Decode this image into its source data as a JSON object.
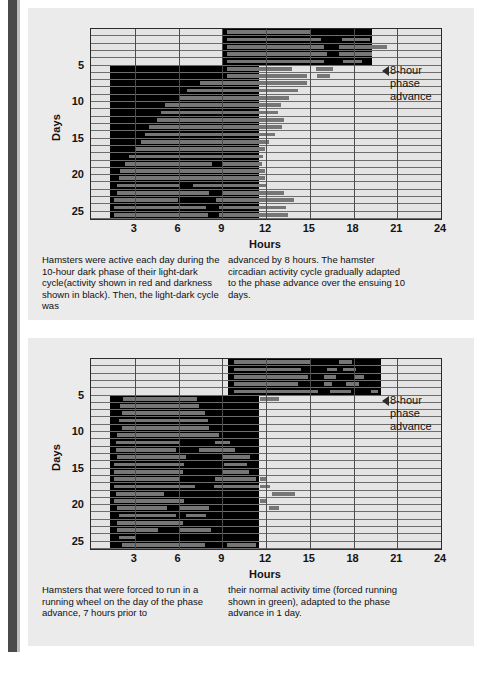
{
  "page": {
    "background": "#ffffff",
    "panel_background": "#ebebeb",
    "spine_color": "#4a4a4a",
    "ink": "#111111"
  },
  "panels": [
    {
      "id": "top",
      "annotation": {
        "icon": "left-arrow-icon",
        "lines": [
          "8-hour",
          "phase",
          "advance"
        ]
      },
      "caption": {
        "left": "Hamsters were active each day during the 10-hour dark phase of their light-dark cycle(activity shown in red and darkness shown in black). Then, the light-dark cycle was",
        "right": "advanced by 8 hours. The hamster circadian activity cycle gradually adapted to the phase advance over the ensuing 10 days."
      },
      "chart_data": {
        "type": "actogram",
        "title": "",
        "xlabel": "Hours",
        "ylabel": "Days",
        "xlim": [
          0,
          24
        ],
        "ylim": [
          0,
          27
        ],
        "xticks": [
          3,
          6,
          9,
          12,
          15,
          18,
          21,
          24
        ],
        "yticks": [
          5,
          10,
          15,
          20,
          25
        ],
        "grid": true,
        "legend": [
          {
            "name": "darkness",
            "color": "#000000"
          },
          {
            "name": "activity",
            "color": "#767676"
          }
        ],
        "phase_advance_after_day": 5,
        "phase_advance_hours": 8,
        "dark_color": "#000000",
        "activity_color": "#767676",
        "rows": [
          {
            "day": 1,
            "dark": [
              9.0,
              19.3
            ],
            "activity": [
              [
                9.3,
                15.0
              ]
            ]
          },
          {
            "day": 2,
            "dark": [
              9.0,
              19.3
            ],
            "activity": [
              [
                9.3,
                15.8
              ],
              [
                17.2,
                19.1
              ]
            ]
          },
          {
            "day": 3,
            "dark": [
              9.0,
              19.3
            ],
            "activity": [
              [
                9.3,
                16.0
              ],
              [
                17.0,
                20.3
              ]
            ]
          },
          {
            "day": 4,
            "dark": [
              9.0,
              19.3
            ],
            "activity": [
              [
                9.3,
                16.2
              ],
              [
                17.0,
                19.3
              ]
            ]
          },
          {
            "day": 5,
            "dark": [
              9.0,
              19.3
            ],
            "activity": [
              [
                9.3,
                16.0
              ],
              [
                17.3,
                18.6
              ]
            ]
          },
          {
            "day": 6,
            "dark": [
              1.3,
              11.5
            ],
            "activity": [
              [
                9.3,
                13.8
              ],
              [
                15.4,
                16.6
              ]
            ]
          },
          {
            "day": 7,
            "dark": [
              1.3,
              11.5
            ],
            "activity": [
              [
                9.3,
                14.8
              ],
              [
                15.5,
                16.4
              ]
            ]
          },
          {
            "day": 8,
            "dark": [
              1.3,
              11.5
            ],
            "activity": [
              [
                7.5,
                14.8
              ]
            ]
          },
          {
            "day": 9,
            "dark": [
              1.3,
              11.5
            ],
            "activity": [
              [
                6.6,
                14.2
              ]
            ]
          },
          {
            "day": 10,
            "dark": [
              1.3,
              11.5
            ],
            "activity": [
              [
                6.1,
                13.6
              ]
            ]
          },
          {
            "day": 11,
            "dark": [
              1.3,
              11.5
            ],
            "activity": [
              [
                5.1,
                13.0
              ]
            ]
          },
          {
            "day": 12,
            "dark": [
              1.3,
              11.5
            ],
            "activity": [
              [
                4.8,
                12.8
              ]
            ]
          },
          {
            "day": 13,
            "dark": [
              1.3,
              11.5
            ],
            "activity": [
              [
                4.5,
                13.2
              ]
            ]
          },
          {
            "day": 14,
            "dark": [
              1.3,
              11.5
            ],
            "activity": [
              [
                4.0,
                13.1
              ]
            ]
          },
          {
            "day": 15,
            "dark": [
              1.3,
              11.5
            ],
            "activity": [
              [
                3.7,
                12.6
              ]
            ]
          },
          {
            "day": 16,
            "dark": [
              1.3,
              11.5
            ],
            "activity": [
              [
                3.4,
                12.2
              ]
            ]
          },
          {
            "day": 17,
            "dark": [
              1.3,
              11.5
            ],
            "activity": [
              [
                3.1,
                11.9
              ]
            ]
          },
          {
            "day": 18,
            "dark": [
              1.3,
              11.5
            ],
            "activity": [
              [
                2.6,
                11.8
              ]
            ]
          },
          {
            "day": 19,
            "dark": [
              1.3,
              11.5
            ],
            "activity": [
              [
                2.3,
                8.3
              ],
              [
                9.0,
                11.7
              ]
            ]
          },
          {
            "day": 20,
            "dark": [
              1.3,
              11.5
            ],
            "activity": [
              [
                2.0,
                11.9
              ]
            ]
          },
          {
            "day": 21,
            "dark": [
              1.3,
              11.5
            ],
            "activity": [
              [
                1.9,
                11.9
              ]
            ]
          },
          {
            "day": 22,
            "dark": [
              1.3,
              11.5
            ],
            "activity": [
              [
                1.8,
                6.1
              ],
              [
                7.0,
                12.1
              ]
            ]
          },
          {
            "day": 23,
            "dark": [
              1.3,
              11.5
            ],
            "activity": [
              [
                1.8,
                8.1
              ],
              [
                9.0,
                13.2
              ]
            ]
          },
          {
            "day": 24,
            "dark": [
              1.3,
              11.5
            ],
            "activity": [
              [
                1.6,
                6.0
              ],
              [
                8.6,
                13.9
              ]
            ]
          },
          {
            "day": 25,
            "dark": [
              1.3,
              11.5
            ],
            "activity": [
              [
                1.6,
                7.9
              ],
              [
                8.8,
                13.4
              ]
            ]
          },
          {
            "day": 26,
            "dark": [
              1.3,
              11.5
            ],
            "activity": [
              [
                1.6,
                8.0
              ],
              [
                8.8,
                13.5
              ]
            ]
          }
        ]
      }
    },
    {
      "id": "bottom",
      "annotation": {
        "icon": "left-arrow-icon",
        "lines": [
          "8-hour",
          "phase",
          "advance"
        ]
      },
      "caption": {
        "left": "Hamsters that were forced to run in a running wheel on the day of the phase advance, 7 hours prior to",
        "right": "their normal activity time (forced running shown in green), adapted to the phase advance in 1 day."
      },
      "chart_data": {
        "type": "actogram",
        "title": "",
        "xlabel": "Hours",
        "ylabel": "Days",
        "xlim": [
          0,
          24
        ],
        "ylim": [
          0,
          27
        ],
        "xticks": [
          3,
          6,
          9,
          12,
          15,
          18,
          21,
          24
        ],
        "yticks": [
          5,
          10,
          15,
          20,
          25
        ],
        "grid": true,
        "legend": [
          {
            "name": "darkness",
            "color": "#000000"
          },
          {
            "name": "activity",
            "color": "#767676"
          },
          {
            "name": "forced-running",
            "color": "#5e5e5e"
          }
        ],
        "phase_advance_after_day": 5,
        "phase_advance_hours": 8,
        "dark_color": "#000000",
        "activity_color": "#767676",
        "rows": [
          {
            "day": 1,
            "dark": [
              9.4,
              19.9
            ],
            "activity": [
              [
                9.8,
                15.1
              ],
              [
                17.0,
                17.9
              ]
            ]
          },
          {
            "day": 2,
            "dark": [
              9.4,
              19.9
            ],
            "activity": [
              [
                9.8,
                14.4
              ],
              [
                16.2,
                16.9
              ],
              [
                17.3,
                18.2
              ]
            ]
          },
          {
            "day": 3,
            "dark": [
              9.4,
              19.9
            ],
            "activity": [
              [
                9.8,
                14.9
              ],
              [
                16.0,
                16.8
              ],
              [
                18.0,
                18.7
              ]
            ]
          },
          {
            "day": 4,
            "dark": [
              9.4,
              19.9
            ],
            "activity": [
              [
                9.8,
                14.2
              ],
              [
                16.0,
                16.5
              ],
              [
                17.5,
                18.4
              ]
            ]
          },
          {
            "day": 5,
            "dark": [
              9.4,
              19.9
            ],
            "activity": [
              [
                9.8,
                15.6
              ],
              [
                16.4,
                17.8
              ],
              [
                19.2,
                19.7
              ]
            ]
          },
          {
            "day": 6,
            "dark": [
              1.3,
              11.5
            ],
            "activity": [
              [
                2.2,
                7.3
              ],
              [
                11.6,
                12.9
              ]
            ]
          },
          {
            "day": 7,
            "dark": [
              1.3,
              11.5
            ],
            "activity": [
              [
                2.0,
                7.4
              ]
            ]
          },
          {
            "day": 8,
            "dark": [
              1.3,
              11.5
            ],
            "activity": [
              [
                2.1,
                7.8
              ]
            ]
          },
          {
            "day": 9,
            "dark": [
              1.3,
              11.5
            ],
            "activity": [
              [
                1.9,
                8.0
              ]
            ]
          },
          {
            "day": 10,
            "dark": [
              1.3,
              11.5
            ],
            "activity": [
              [
                2.1,
                8.1
              ]
            ]
          },
          {
            "day": 11,
            "dark": [
              1.3,
              11.5
            ],
            "activity": [
              [
                1.8,
                8.8
              ]
            ]
          },
          {
            "day": 12,
            "dark": [
              1.3,
              11.5
            ],
            "activity": [
              [
                1.7,
                6.1
              ],
              [
                8.5,
                9.5
              ]
            ]
          },
          {
            "day": 13,
            "dark": [
              1.3,
              11.5
            ],
            "activity": [
              [
                1.7,
                5.8
              ],
              [
                7.4,
                9.9
              ]
            ]
          },
          {
            "day": 14,
            "dark": [
              1.3,
              11.5
            ],
            "activity": [
              [
                1.8,
                6.5
              ],
              [
                9.0,
                10.9
              ]
            ]
          },
          {
            "day": 15,
            "dark": [
              1.3,
              11.5
            ],
            "activity": [
              [
                1.6,
                6.4
              ],
              [
                9.1,
                10.7
              ]
            ]
          },
          {
            "day": 16,
            "dark": [
              1.3,
              11.5
            ],
            "activity": [
              [
                1.6,
                6.3
              ],
              [
                9.0,
                10.8
              ]
            ]
          },
          {
            "day": 17,
            "dark": [
              1.3,
              11.5
            ],
            "activity": [
              [
                1.6,
                6.1
              ],
              [
                8.5,
                11.3
              ],
              [
                11.6,
                12.0
              ]
            ]
          },
          {
            "day": 18,
            "dark": [
              1.3,
              11.5
            ],
            "activity": [
              [
                1.6,
                7.1
              ],
              [
                8.4,
                11.5
              ],
              [
                11.6,
                12.3
              ]
            ]
          },
          {
            "day": 19,
            "dark": [
              1.3,
              11.5
            ],
            "activity": [
              [
                1.7,
                5.0
              ],
              [
                12.4,
                14.0
              ]
            ]
          },
          {
            "day": 20,
            "dark": [
              1.3,
              11.5
            ],
            "activity": [
              [
                1.6,
                6.4
              ],
              [
                11.6,
                12.1
              ]
            ]
          },
          {
            "day": 21,
            "dark": [
              1.3,
              11.5
            ],
            "activity": [
              [
                1.8,
                5.2
              ],
              [
                6.1,
                8.1
              ],
              [
                12.2,
                12.9
              ]
            ]
          },
          {
            "day": 22,
            "dark": [
              1.3,
              11.5
            ],
            "activity": [
              [
                1.9,
                5.8
              ],
              [
                6.5,
                7.9
              ]
            ]
          },
          {
            "day": 23,
            "dark": [
              1.3,
              11.5
            ],
            "activity": [
              [
                1.8,
                6.3
              ]
            ]
          },
          {
            "day": 24,
            "dark": [
              1.3,
              11.5
            ],
            "activity": [
              [
                1.8,
                4.6
              ],
              [
                6.0,
                8.2
              ]
            ]
          },
          {
            "day": 25,
            "dark": [
              1.3,
              11.5
            ],
            "activity": [
              [
                1.9,
                3.0
              ]
            ]
          },
          {
            "day": 26,
            "dark": [
              1.3,
              11.5
            ],
            "activity": [
              [
                2.1,
                7.8
              ],
              [
                9.3,
                11.3
              ]
            ]
          }
        ]
      }
    }
  ]
}
